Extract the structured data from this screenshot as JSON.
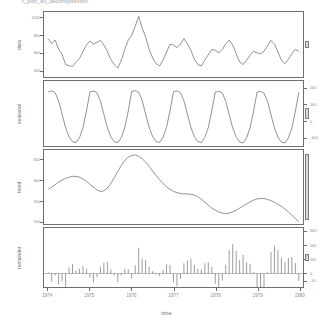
{
  "title": "r_plot_stl_decomposition",
  "axis": {
    "xlabel": "time",
    "xticks": [
      "1974",
      "1975",
      "1976",
      "1977",
      "1978",
      "1979",
      "1980"
    ]
  },
  "panels": [
    {
      "name": "data",
      "ylabel": "data",
      "yticks": [
        "400",
        "600",
        "800",
        "1000"
      ],
      "side": "left"
    },
    {
      "name": "seasonal",
      "ylabel": "seasonal",
      "yticks": [
        "-100",
        "0",
        "100",
        "200"
      ],
      "side": "right"
    },
    {
      "name": "trend",
      "ylabel": "trend",
      "yticks": [
        "500",
        "550",
        "600",
        "650"
      ],
      "side": "left"
    },
    {
      "name": "remainder",
      "ylabel": "remainder",
      "yticks": [
        "-50",
        "0",
        "100",
        "200",
        "300"
      ],
      "side": "right"
    }
  ],
  "chart_data": {
    "type": "line",
    "title": "r_plot_stl_decomposition",
    "xlabel": "time",
    "ylabel": "",
    "xlim": [
      1973.9,
      1980.1
    ],
    "grid": false,
    "legend": null,
    "x": [
      1974.0,
      1974.083,
      1974.167,
      1974.25,
      1974.333,
      1974.417,
      1974.5,
      1974.583,
      1974.667,
      1974.75,
      1974.833,
      1974.917,
      1975.0,
      1975.083,
      1975.167,
      1975.25,
      1975.333,
      1975.417,
      1975.5,
      1975.583,
      1975.667,
      1975.75,
      1975.833,
      1975.917,
      1976.0,
      1976.083,
      1976.167,
      1976.25,
      1976.333,
      1976.417,
      1976.5,
      1976.583,
      1976.667,
      1976.75,
      1976.833,
      1976.917,
      1977.0,
      1977.083,
      1977.167,
      1977.25,
      1977.333,
      1977.417,
      1977.5,
      1977.583,
      1977.667,
      1977.75,
      1977.833,
      1977.917,
      1978.0,
      1978.083,
      1978.167,
      1978.25,
      1978.333,
      1978.417,
      1978.5,
      1978.583,
      1978.667,
      1978.75,
      1978.833,
      1978.917,
      1979.0,
      1979.083,
      1979.167,
      1979.25,
      1979.333,
      1979.417,
      1979.5,
      1979.583,
      1979.667,
      1979.75,
      1979.833,
      1979.917,
      1980.0
    ],
    "series": [
      {
        "name": "data",
        "panel": "data",
        "ylim": [
          330,
          1060
        ],
        "yticks": [
          400,
          600,
          800,
          1000
        ],
        "values": [
          760,
          705,
          745,
          640,
          585,
          470,
          455,
          450,
          500,
          540,
          615,
          690,
          735,
          700,
          720,
          740,
          690,
          620,
          525,
          470,
          430,
          520,
          640,
          745,
          800,
          900,
          1010,
          880,
          780,
          640,
          545,
          480,
          455,
          520,
          610,
          700,
          690,
          660,
          700,
          760,
          700,
          630,
          530,
          470,
          455,
          520,
          580,
          640,
          630,
          600,
          640,
          700,
          745,
          690,
          590,
          500,
          470,
          520,
          575,
          620,
          600,
          590,
          620,
          680,
          740,
          700,
          610,
          520,
          480,
          530,
          590,
          640,
          620
        ]
      },
      {
        "name": "seasonal",
        "panel": "seasonal",
        "ylim": [
          -150,
          240
        ],
        "yticks": [
          -100,
          0,
          100,
          200
        ],
        "values": [
          175,
          180,
          170,
          120,
          40,
          -40,
          -95,
          -125,
          -130,
          -100,
          -40,
          60,
          175,
          180,
          170,
          120,
          40,
          -40,
          -95,
          -125,
          -130,
          -100,
          -40,
          60,
          178,
          182,
          172,
          122,
          42,
          -38,
          -93,
          -123,
          -128,
          -98,
          -38,
          62,
          176,
          181,
          171,
          121,
          41,
          -39,
          -94,
          -124,
          -129,
          -99,
          -39,
          61,
          174,
          179,
          169,
          119,
          39,
          -41,
          -96,
          -126,
          -131,
          -101,
          -41,
          59,
          173,
          178,
          168,
          118,
          38,
          -42,
          -97,
          -127,
          -132,
          -102,
          -42,
          58,
          172
        ]
      },
      {
        "name": "trend",
        "panel": "trend",
        "ylim": [
          495,
          672
        ],
        "yticks": [
          500,
          550,
          600,
          650
        ],
        "values": [
          578,
          583,
          589,
          595,
          600,
          604,
          607,
          609,
          609,
          607,
          603,
          597,
          590,
          583,
          577,
          573,
          574,
          581,
          592,
          606,
          621,
          635,
          647,
          655,
          659,
          660,
          657,
          651,
          643,
          633,
          622,
          611,
          601,
          592,
          584,
          578,
          573,
          570,
          568,
          567,
          567,
          566,
          564,
          560,
          554,
          547,
          540,
          533,
          528,
          524,
          521,
          520,
          521,
          524,
          528,
          533,
          538,
          543,
          548,
          552,
          555,
          556,
          556,
          554,
          551,
          547,
          542,
          537,
          531,
          524,
          516,
          508,
          500
        ]
      },
      {
        "name": "remainder",
        "panel": "remainder",
        "ylim": [
          -95,
          320
        ],
        "yticks": [
          -50,
          0,
          100,
          200,
          300
        ],
        "values": [
          7,
          -58,
          -14,
          -75,
          -55,
          -94,
          43,
          66,
          21,
          33,
          52,
          33,
          -30,
          -63,
          -27,
          47,
          76,
          79,
          28,
          -11,
          -61,
          -15,
          33,
          30,
          -37,
          58,
          181,
          107,
          95,
          45,
          16,
          -8,
          -18,
          26,
          64,
          60,
          -59,
          -91,
          -39,
          72,
          92,
          103,
          60,
          34,
          30,
          72,
          79,
          46,
          -72,
          -103,
          -50,
          61,
          165,
          207,
          158,
          93,
          131,
          78,
          68,
          9,
          -128,
          -144,
          -104,
          8,
          151,
          195,
          165,
          110,
          81,
          108,
          116,
          74,
          -52
        ]
      }
    ],
    "scalebars": [
      {
        "panel": "data",
        "relative_height": 0.1
      },
      {
        "panel": "seasonal",
        "relative_height": 0.16
      },
      {
        "panel": "trend",
        "relative_height": 0.88
      },
      {
        "panel": "remainder",
        "relative_height": 0.13
      }
    ]
  }
}
